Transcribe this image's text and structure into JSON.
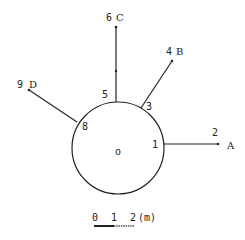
{
  "diagram": {
    "center_label": "o",
    "point_labels": {
      "p1": "1",
      "p2": "2",
      "p3": "3",
      "p4": "4",
      "p5": "5",
      "p6": "6",
      "p8": "8",
      "p9": "9"
    },
    "endpoint_labels": {
      "A": "A",
      "B": "B",
      "C": "C",
      "D": "D"
    },
    "scale_bar": {
      "ticks": [
        "0",
        "1",
        "2"
      ],
      "unit": "(m)"
    },
    "colors": {
      "ink": "#222222",
      "background": "#ffffff"
    }
  }
}
